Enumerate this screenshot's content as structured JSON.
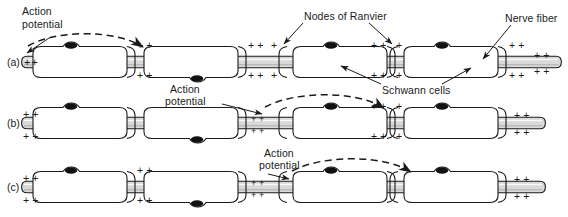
{
  "figure": {
    "type": "diagram",
    "panels": [
      {
        "id": "a",
        "label": "(a)",
        "action_potential_label": "Action\npotential",
        "impulse_at_segment": 1
      },
      {
        "id": "b",
        "label": "(b)",
        "action_potential_label": "Action\npotential",
        "impulse_at_segment": 2
      },
      {
        "id": "c",
        "label": "(c)",
        "action_potential_label": "Action\npotential",
        "impulse_at_segment": 3
      }
    ],
    "annotations": [
      {
        "name": "nodes-of-ranvier",
        "text": "Nodes of Ranvier"
      },
      {
        "name": "nerve-fiber",
        "text": "Nerve fiber"
      },
      {
        "name": "schwann-cells",
        "text": "Schwann cells"
      }
    ],
    "charge_marker": "+ +",
    "charge_marker_single": "+",
    "colors": {
      "ink": "#1a1a1a",
      "axon_fill": "#d9d9d9",
      "myelin_fill": "#ffffff",
      "nucleus": "#111111",
      "background": "#ffffff"
    }
  },
  "row_a": {
    "label": "(a)",
    "action_potential": "Action",
    "action_potential_2": "potential",
    "charges": [
      "+ +",
      "+ +",
      "+ +",
      "+ +",
      "+ +",
      "+ +",
      "+ +",
      "+ +",
      "+ +",
      "+ +"
    ]
  },
  "row_b": {
    "label": "(b)",
    "action_potential": "Action",
    "action_potential_2": "potential",
    "charges": [
      "+ +",
      "+ +",
      "+ +",
      "+ +",
      "+ +",
      "+ +",
      "+ +",
      "+ +"
    ]
  },
  "row_c": {
    "label": "(c)",
    "action_potential": "Action",
    "action_potential_2": "potential",
    "charges": [
      "+ +",
      "+ +",
      "+ +",
      "+ +",
      "+ +",
      "+ +",
      "+ +",
      "+ +"
    ]
  },
  "callouts": {
    "nodes_of_ranvier": "Nodes of Ranvier",
    "nerve_fiber": "Nerve fiber",
    "schwann_cells": "Schwann cells"
  }
}
